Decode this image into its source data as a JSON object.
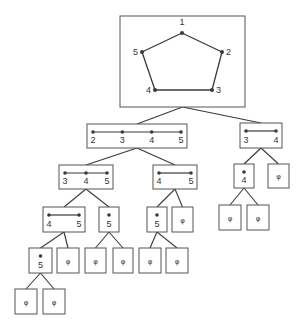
{
  "diagram": {
    "type": "tree",
    "root": {
      "graph": "pentagon",
      "vertices": [
        {
          "id": "v1",
          "label": "1",
          "x": 182,
          "y": 33,
          "lx": 182,
          "ly": 25,
          "anchor": "middle"
        },
        {
          "id": "v2",
          "label": "2",
          "x": 222,
          "y": 52,
          "lx": 226,
          "ly": 55,
          "anchor": "start"
        },
        {
          "id": "v3",
          "label": "3",
          "x": 212,
          "y": 90,
          "lx": 216,
          "ly": 93,
          "anchor": "start"
        },
        {
          "id": "v4",
          "label": "4",
          "x": 155,
          "y": 90,
          "lx": 151,
          "ly": 93,
          "anchor": "end"
        },
        {
          "id": "v5",
          "label": "5",
          "x": 142,
          "y": 52,
          "lx": 138,
          "ly": 55,
          "anchor": "end"
        }
      ],
      "edges": [
        [
          "v1",
          "v2"
        ],
        [
          "v2",
          "v3"
        ],
        [
          "v3",
          "v4"
        ],
        [
          "v4",
          "v5"
        ],
        [
          "v5",
          "v1"
        ]
      ]
    },
    "empty_symbol": "φ",
    "nodes": [
      {
        "id": "n_root",
        "kind": "root",
        "x": 120,
        "y": 16,
        "w": 125,
        "h": 91
      },
      {
        "id": "n_2345",
        "kind": "path",
        "labels": [
          "2",
          "3",
          "4",
          "5"
        ],
        "x": 87,
        "y": 124,
        "w": 100,
        "h": 24
      },
      {
        "id": "n_34_r",
        "kind": "path",
        "labels": [
          "3",
          "4"
        ],
        "x": 240,
        "y": 123,
        "w": 42,
        "h": 25
      },
      {
        "id": "n_345",
        "kind": "path",
        "labels": [
          "3",
          "4",
          "5"
        ],
        "x": 59,
        "y": 165,
        "w": 54,
        "h": 24
      },
      {
        "id": "n_45_a",
        "kind": "path",
        "labels": [
          "4",
          "5"
        ],
        "x": 153,
        "y": 165,
        "w": 44,
        "h": 24
      },
      {
        "id": "n_4_r",
        "kind": "point",
        "labels": [
          "4"
        ],
        "x": 234,
        "y": 164,
        "w": 20,
        "h": 24
      },
      {
        "id": "n_phi_r1",
        "kind": "empty",
        "labels": [
          "φ"
        ],
        "x": 268,
        "y": 164,
        "w": 21,
        "h": 24
      },
      {
        "id": "n_45_b",
        "kind": "path",
        "labels": [
          "4",
          "5"
        ],
        "x": 43,
        "y": 207,
        "w": 42,
        "h": 25
      },
      {
        "id": "n_5_a",
        "kind": "point",
        "labels": [
          "5"
        ],
        "x": 99,
        "y": 207,
        "w": 20,
        "h": 25
      },
      {
        "id": "n_5_b",
        "kind": "point",
        "labels": [
          "5"
        ],
        "x": 147,
        "y": 207,
        "w": 20,
        "h": 25
      },
      {
        "id": "n_phi_1",
        "kind": "empty",
        "labels": [
          "φ"
        ],
        "x": 172,
        "y": 207,
        "w": 21,
        "h": 25
      },
      {
        "id": "n_phi_r2",
        "kind": "empty",
        "labels": [
          "φ"
        ],
        "x": 219,
        "y": 205,
        "w": 22,
        "h": 25
      },
      {
        "id": "n_phi_r3",
        "kind": "empty",
        "labels": [
          "φ"
        ],
        "x": 247,
        "y": 205,
        "w": 22,
        "h": 25
      },
      {
        "id": "n_5_c",
        "kind": "point",
        "labels": [
          "5"
        ],
        "x": 29,
        "y": 248,
        "w": 23,
        "h": 25
      },
      {
        "id": "n_phi_2",
        "kind": "empty",
        "labels": [
          "φ"
        ],
        "x": 57,
        "y": 248,
        "w": 22,
        "h": 25
      },
      {
        "id": "n_phi_3",
        "kind": "empty",
        "labels": [
          "φ"
        ],
        "x": 85,
        "y": 248,
        "w": 21,
        "h": 25
      },
      {
        "id": "n_phi_4",
        "kind": "empty",
        "labels": [
          "φ"
        ],
        "x": 113,
        "y": 248,
        "w": 20,
        "h": 25
      },
      {
        "id": "n_phi_5",
        "kind": "empty",
        "labels": [
          "φ"
        ],
        "x": 139,
        "y": 248,
        "w": 22,
        "h": 25
      },
      {
        "id": "n_phi_6",
        "kind": "empty",
        "labels": [
          "φ"
        ],
        "x": 166,
        "y": 248,
        "w": 22,
        "h": 25
      },
      {
        "id": "n_phi_7",
        "kind": "empty",
        "labels": [
          "φ"
        ],
        "x": 15,
        "y": 289,
        "w": 22,
        "h": 25
      },
      {
        "id": "n_phi_8",
        "kind": "empty",
        "labels": [
          "φ"
        ],
        "x": 43,
        "y": 289,
        "w": 22,
        "h": 25
      }
    ],
    "links": [
      [
        "n_root",
        "n_2345"
      ],
      [
        "n_root",
        "n_34_r"
      ],
      [
        "n_2345",
        "n_345"
      ],
      [
        "n_2345",
        "n_45_a"
      ],
      [
        "n_34_r",
        "n_4_r"
      ],
      [
        "n_34_r",
        "n_phi_r1"
      ],
      [
        "n_345",
        "n_45_b"
      ],
      [
        "n_345",
        "n_5_a"
      ],
      [
        "n_45_a",
        "n_5_b"
      ],
      [
        "n_45_a",
        "n_phi_1"
      ],
      [
        "n_4_r",
        "n_phi_r2"
      ],
      [
        "n_4_r",
        "n_phi_r3"
      ],
      [
        "n_45_b",
        "n_5_c"
      ],
      [
        "n_45_b",
        "n_phi_2"
      ],
      [
        "n_5_a",
        "n_phi_3"
      ],
      [
        "n_5_a",
        "n_phi_4"
      ],
      [
        "n_5_b",
        "n_phi_5"
      ],
      [
        "n_5_b",
        "n_phi_6"
      ],
      [
        "n_5_c",
        "n_phi_7"
      ],
      [
        "n_5_c",
        "n_phi_8"
      ]
    ]
  },
  "colors": {
    "line": "#3a3a3a",
    "box": "#555555",
    "text": "#333333",
    "background": "#ffffff"
  }
}
